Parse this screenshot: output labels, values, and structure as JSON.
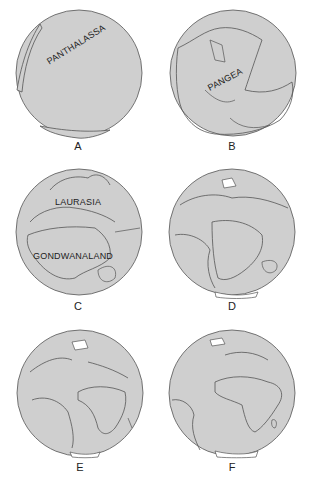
{
  "figure": {
    "colors": {
      "ocean": "#cfcfcf",
      "outline": "#555555",
      "ice": "#ffffff",
      "background": "#ffffff"
    },
    "panels": [
      {
        "id": "A",
        "caption": "A",
        "labels": [
          "PANTHALASSA"
        ]
      },
      {
        "id": "B",
        "caption": "B",
        "labels": [
          "PANGEA"
        ]
      },
      {
        "id": "C",
        "caption": "C",
        "labels": [
          "LAURASIA",
          "GONDWANALAND"
        ]
      },
      {
        "id": "D",
        "caption": "D",
        "labels": []
      },
      {
        "id": "E",
        "caption": "E",
        "labels": []
      },
      {
        "id": "F",
        "caption": "F",
        "labels": []
      }
    ]
  }
}
